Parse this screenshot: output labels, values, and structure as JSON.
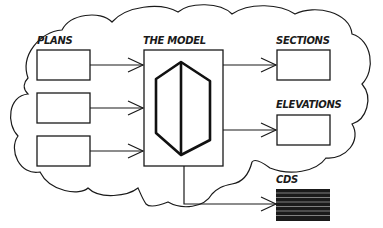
{
  "diagram": {
    "labels": {
      "plans": "PLANS",
      "model": "THE MODEL",
      "sections": "SECTIONS",
      "elevations": "ELEVATIONS",
      "cds": "CDS"
    },
    "colors": {
      "stroke": "#1a1a1a",
      "background": "#ffffff"
    },
    "nodes": [
      {
        "id": "plan-1",
        "group": "plans"
      },
      {
        "id": "plan-2",
        "group": "plans"
      },
      {
        "id": "plan-3",
        "group": "plans"
      },
      {
        "id": "model",
        "group": "model",
        "icon": "hexagonal-prism-icon"
      },
      {
        "id": "section",
        "group": "sections"
      },
      {
        "id": "elevation",
        "group": "elevations"
      },
      {
        "id": "cds",
        "group": "cds",
        "style": "filled-striped"
      }
    ],
    "edges": [
      {
        "from": "plan-1",
        "to": "model"
      },
      {
        "from": "plan-2",
        "to": "model"
      },
      {
        "from": "plan-3",
        "to": "model"
      },
      {
        "from": "model",
        "to": "section"
      },
      {
        "from": "model",
        "to": "elevation"
      },
      {
        "from": "model",
        "to": "cds"
      }
    ]
  }
}
